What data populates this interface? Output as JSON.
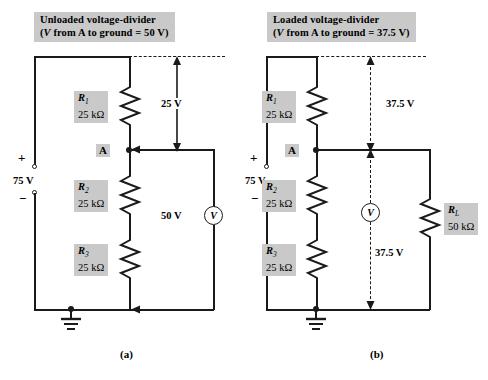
{
  "figure": {
    "caption_a": "(a)",
    "caption_b": "(b)"
  },
  "panels": [
    {
      "id": "a",
      "title_line1": "Unloaded voltage-divider",
      "title_line2_pre": "(",
      "title_v": "V",
      "title_line2_mid": " from ",
      "title_node": "A",
      "title_line2_post": " to ground  =  50 V)",
      "source": {
        "value": "75 V",
        "plus": "+",
        "minus": "−"
      },
      "node_label": "A",
      "resistors": [
        {
          "name": "R",
          "sub": "1",
          "value": "25 kΩ"
        },
        {
          "name": "R",
          "sub": "2",
          "value": "25 kΩ"
        },
        {
          "name": "R",
          "sub": "3",
          "value": "25 kΩ"
        }
      ],
      "measurements": [
        {
          "label": "25 V",
          "style": "solid"
        }
      ],
      "meter": {
        "glyph": "V",
        "reading": "50 V"
      },
      "ground": true
    },
    {
      "id": "b",
      "title_line1": "Loaded voltage-divider",
      "title_line2_pre": "(",
      "title_v": "V",
      "title_line2_mid": " from ",
      "title_node": "A",
      "title_line2_post": " to ground  =  37.5 V)",
      "source": {
        "value": "75 V",
        "plus": "+",
        "minus": "−"
      },
      "node_label": "A",
      "resistors": [
        {
          "name": "R",
          "sub": "1",
          "value": "25 kΩ"
        },
        {
          "name": "R",
          "sub": "2",
          "value": "25 kΩ"
        },
        {
          "name": "R",
          "sub": "3",
          "value": "25 kΩ"
        },
        {
          "name": "R",
          "sub": "L",
          "value": "50 kΩ"
        }
      ],
      "measurements": [
        {
          "label": "37.5 V",
          "style": "dashed"
        },
        {
          "label": "37.5 V",
          "style": "dashed"
        }
      ],
      "meter": {
        "glyph": "V",
        "reading": "37.5 V"
      },
      "ground": true
    }
  ],
  "colors": {
    "wire": "#1a1a1a",
    "label_fill": "#c9c9c9",
    "background": "#ffffff"
  }
}
